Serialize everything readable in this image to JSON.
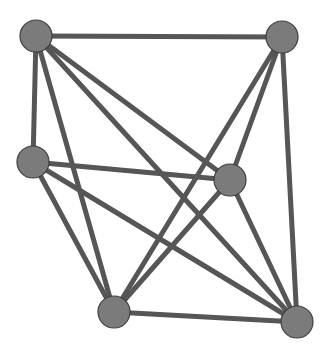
{
  "diagram": {
    "type": "graph",
    "directed": false,
    "colors": {
      "background": "#ffffff",
      "edge": "#565656",
      "node_fill": "#7b7b7b",
      "node_stroke": "#3f3f3f"
    },
    "node_radius": 16,
    "edge_width": 5,
    "nodes": [
      {
        "id": "A",
        "x": 36,
        "y": 36
      },
      {
        "id": "B",
        "x": 282,
        "y": 37
      },
      {
        "id": "C",
        "x": 33,
        "y": 162
      },
      {
        "id": "D",
        "x": 230,
        "y": 180
      },
      {
        "id": "E",
        "x": 114,
        "y": 312
      },
      {
        "id": "F",
        "x": 297,
        "y": 322
      }
    ],
    "edges": [
      [
        "A",
        "B"
      ],
      [
        "A",
        "C"
      ],
      [
        "A",
        "D"
      ],
      [
        "A",
        "E"
      ],
      [
        "A",
        "F"
      ],
      [
        "B",
        "D"
      ],
      [
        "B",
        "E"
      ],
      [
        "B",
        "F"
      ],
      [
        "C",
        "D"
      ],
      [
        "C",
        "E"
      ],
      [
        "C",
        "F"
      ],
      [
        "D",
        "E"
      ],
      [
        "D",
        "F"
      ],
      [
        "E",
        "F"
      ]
    ]
  }
}
